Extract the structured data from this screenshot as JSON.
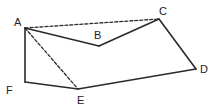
{
  "diagram": {
    "type": "geometry-polygon",
    "colors": {
      "stroke": "#2a2a2a",
      "label": "#222222",
      "background": "#ffffff"
    },
    "vertices": [
      {
        "id": "A",
        "label": "A",
        "x": 25,
        "y": 28,
        "label_x": 14,
        "label_y": 26
      },
      {
        "id": "B",
        "label": "B",
        "x": 99,
        "y": 46,
        "label_x": 94,
        "label_y": 39
      },
      {
        "id": "C",
        "label": "C",
        "x": 159,
        "y": 19,
        "label_x": 159,
        "label_y": 15
      },
      {
        "id": "D",
        "label": "D",
        "x": 196,
        "y": 69,
        "label_x": 200,
        "label_y": 73
      },
      {
        "id": "E",
        "label": "E",
        "x": 78,
        "y": 89,
        "label_x": 77,
        "label_y": 104
      },
      {
        "id": "F",
        "label": "F",
        "x": 25,
        "y": 82,
        "label_x": 6,
        "label_y": 94
      }
    ],
    "edges": [
      {
        "from": "A",
        "to": "B",
        "style": "solid"
      },
      {
        "from": "B",
        "to": "C",
        "style": "solid"
      },
      {
        "from": "C",
        "to": "D",
        "style": "solid"
      },
      {
        "from": "D",
        "to": "E",
        "style": "solid"
      },
      {
        "from": "E",
        "to": "F",
        "style": "solid"
      },
      {
        "from": "F",
        "to": "A",
        "style": "solid"
      },
      {
        "from": "A",
        "to": "C",
        "style": "dashed"
      },
      {
        "from": "A",
        "to": "E",
        "style": "dashed"
      }
    ]
  }
}
